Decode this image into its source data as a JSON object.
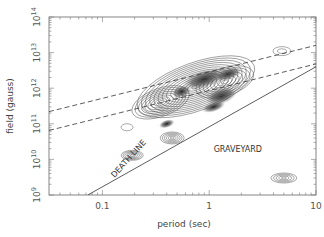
{
  "chart_data": {
    "type": "contour",
    "title": "",
    "xlabel": "period (sec)",
    "ylabel": "field (gauss)",
    "xscale": "log",
    "yscale": "log",
    "xlim": [
      0.0316,
      10
    ],
    "ylim": [
      1000000000.0,
      100000000000000.0
    ],
    "x_ticks": [
      {
        "value": 0.1,
        "label": "0.1"
      },
      {
        "value": 1,
        "label": "1"
      },
      {
        "value": 10,
        "label": "10"
      }
    ],
    "y_ticks": [
      {
        "value": 1000000000.0,
        "base": "10",
        "exp": "9"
      },
      {
        "value": 10000000000.0,
        "base": "10",
        "exp": "10"
      },
      {
        "value": 100000000000.0,
        "base": "10",
        "exp": "11"
      },
      {
        "value": 1000000000000.0,
        "base": "10",
        "exp": "12"
      },
      {
        "value": 10000000000000.0,
        "base": "10",
        "exp": "13"
      },
      {
        "value": 100000000000000.0,
        "base": "10",
        "exp": "14"
      }
    ],
    "grid": false,
    "legend": null,
    "lines": [
      {
        "name": "upper-dashed",
        "style": "dashed",
        "from": [
          0.0316,
          220000000000.0
        ],
        "to": [
          10,
          16000000000000.0
        ]
      },
      {
        "name": "lower-dashed",
        "style": "dashed",
        "from": [
          0.0316,
          65000000000.0
        ],
        "to": [
          10,
          4800000000000.0
        ]
      },
      {
        "name": "death-line",
        "style": "solid",
        "from": [
          0.073,
          1000000000.0
        ],
        "to": [
          10,
          4000000000000.0
        ]
      }
    ],
    "annotations": [
      {
        "text": "DEATH LINE",
        "x": 0.13,
        "y": 3000000000.0,
        "rotation": -48
      },
      {
        "text": "GRAVEYARD",
        "x": 1.1,
        "y": 16000000000.0
      }
    ],
    "density_clusters": [
      {
        "center_period": 0.6,
        "center_field": 1000000000000.0,
        "description": "main pulsar population, densest shaded region",
        "extent_period": [
          0.12,
          3.5
        ],
        "extent_field": [
          100000000000.0,
          10000000000000.0
        ]
      },
      {
        "center_period": 0.45,
        "center_field": 40000000000.0,
        "description": "small cluster"
      },
      {
        "center_period": 0.19,
        "center_field": 13000000000.0,
        "description": "small cluster"
      },
      {
        "center_period": 0.17,
        "center_field": 80000000000.0,
        "description": "single isolated contour"
      },
      {
        "center_period": 4.8,
        "center_field": 11000000000000.0,
        "description": "small isolated contour (magnetar-like)"
      },
      {
        "center_period": 5.0,
        "center_field": 3000000000.0,
        "description": "isolated cluster in graveyard"
      }
    ]
  }
}
